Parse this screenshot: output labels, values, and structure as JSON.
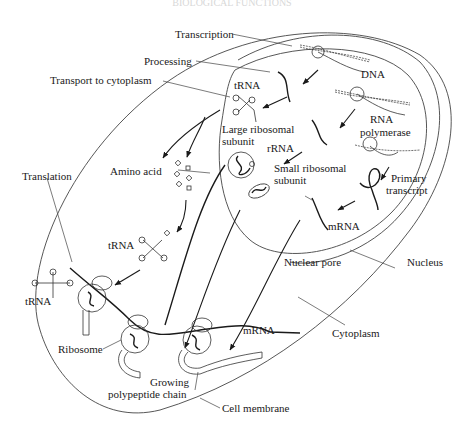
{
  "header": {
    "faded_text": "BIOLOGICAL FUNCTIONS"
  },
  "labels": {
    "transcription": "Transcription",
    "processing": "Processing",
    "dna": "DNA",
    "transport": "Transport to cytoplasm",
    "trna_nucleus": "tRNA",
    "rna_polymerase_1": "RNA",
    "rna_polymerase_2": "polymerase",
    "large_subunit_1": "Large ribosomal",
    "large_subunit_2": "subunit",
    "rrna": "rRNA",
    "amino_acid": "Amino acid",
    "small_subunit_1": "Small ribosomal",
    "small_subunit_2": "subunit",
    "primary_transcript_1": "Primary",
    "primary_transcript_2": "transcript",
    "translation": "Translation",
    "mrna_nucleus": "mRNA",
    "trna_cyto": "tRNA",
    "nuclear_pore": "Nuclear pore",
    "nucleus": "Nucleus",
    "trna_left": "tRNA",
    "mrna_cyto": "mRNA",
    "ribosome": "Ribosome",
    "cytoplasm": "Cytoplasm",
    "growing_1": "Growing",
    "growing_2": "polypeptide chain",
    "cell_membrane": "Cell membrane"
  },
  "colors": {
    "ink": "#1a1a1a",
    "line": "#444444",
    "background": "#ffffff"
  }
}
